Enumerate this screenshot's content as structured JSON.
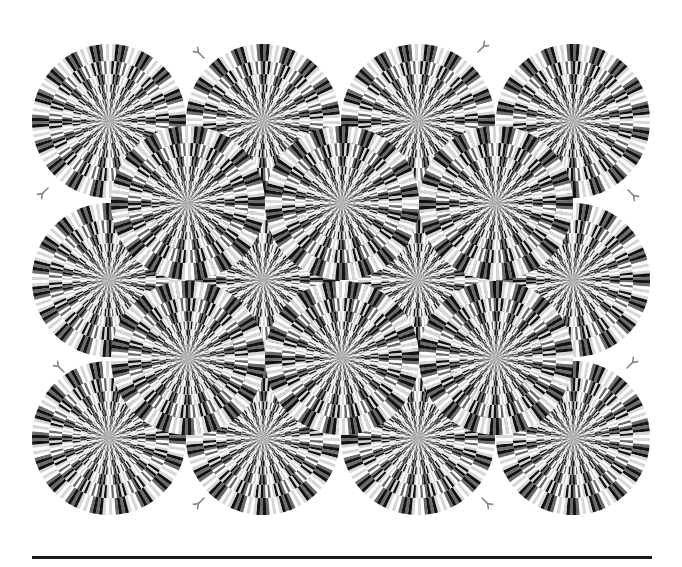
{
  "illusion": {
    "name": "Rotating snakes",
    "colors": {
      "black": "#111111",
      "dark_gray": "#6b6b6b",
      "white": "#ffffff",
      "light_gray": "#d6d6d6",
      "background": "#ffffff",
      "tongue": "#888888"
    },
    "disc_radius": 77,
    "rings": 11,
    "segments_outer": 36,
    "discs": [
      {
        "cx": 109,
        "cy": 121,
        "dir": 1
      },
      {
        "cx": 263,
        "cy": 121,
        "dir": -1
      },
      {
        "cx": 418,
        "cy": 121,
        "dir": 1
      },
      {
        "cx": 573,
        "cy": 121,
        "dir": -1
      },
      {
        "cx": 109,
        "cy": 280,
        "dir": -1
      },
      {
        "cx": 263,
        "cy": 280,
        "dir": 1
      },
      {
        "cx": 418,
        "cy": 280,
        "dir": -1
      },
      {
        "cx": 573,
        "cy": 280,
        "dir": 1
      },
      {
        "cx": 109,
        "cy": 438,
        "dir": 1
      },
      {
        "cx": 263,
        "cy": 438,
        "dir": -1
      },
      {
        "cx": 418,
        "cy": 438,
        "dir": 1
      },
      {
        "cx": 573,
        "cy": 438,
        "dir": -1
      },
      {
        "cx": 188,
        "cy": 203,
        "dir": 1
      },
      {
        "cx": 342,
        "cy": 203,
        "dir": -1
      },
      {
        "cx": 496,
        "cy": 203,
        "dir": 1
      },
      {
        "cx": 188,
        "cy": 358,
        "dir": -1
      },
      {
        "cx": 342,
        "cy": 358,
        "dir": 1
      },
      {
        "cx": 496,
        "cy": 358,
        "dir": -1
      }
    ],
    "tongues": [
      {
        "x": 204,
        "y": 58,
        "angle": -135
      },
      {
        "x": 48,
        "y": 188,
        "angle": 135
      },
      {
        "x": 478,
        "y": 52,
        "angle": -45
      },
      {
        "x": 628,
        "y": 190,
        "angle": 45
      },
      {
        "x": 64,
        "y": 372,
        "angle": -135
      },
      {
        "x": 627,
        "y": 368,
        "angle": -45
      },
      {
        "x": 204,
        "y": 498,
        "angle": 135
      },
      {
        "x": 482,
        "y": 498,
        "angle": 45
      }
    ]
  },
  "baseline": {
    "x1": 32,
    "x2": 652,
    "y": 556
  }
}
